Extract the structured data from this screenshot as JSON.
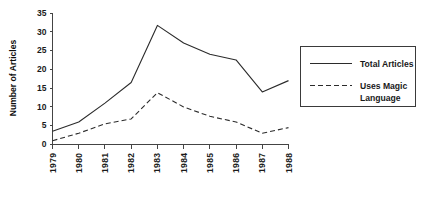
{
  "chart_data": {
    "type": "line",
    "title": "",
    "xlabel": "",
    "ylabel": "Number of Articles",
    "categories": [
      "1979",
      "1980",
      "1981",
      "1982",
      "1983",
      "1984",
      "1985",
      "1986",
      "1987",
      "1988"
    ],
    "ylim": [
      0,
      35
    ],
    "yticks": [
      0,
      5,
      10,
      15,
      20,
      25,
      30,
      35
    ],
    "ytick_labels": [
      "0",
      "5",
      "10",
      "15",
      "20",
      "25",
      "30",
      "35"
    ],
    "grid": false,
    "legend_position": "right",
    "series": [
      {
        "name": "Total  Articles",
        "style": "solid",
        "color": "#2b2b2b",
        "values": [
          3.5,
          6,
          11,
          16.5,
          31.7,
          27,
          24,
          22.5,
          14,
          17
        ]
      },
      {
        "name": "Uses Magic Language",
        "style": "dashed",
        "color": "#2b2b2b",
        "values": [
          1,
          3,
          5.5,
          6.8,
          13.8,
          10,
          7.5,
          6,
          3,
          4.5
        ]
      }
    ]
  },
  "legend": {
    "entries": [
      {
        "label": "Total  Articles",
        "style": "solid"
      },
      {
        "label_line1": "Uses Magic",
        "label_line2": "Language",
        "style": "dashed"
      }
    ]
  },
  "axis": {
    "y_title": "Number of Articles"
  }
}
